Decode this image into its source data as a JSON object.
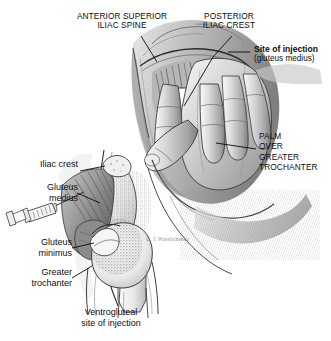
{
  "figure": {
    "background_color": "#ffffff",
    "ink_color": "#1a1a1a"
  },
  "labels": {
    "anterior_superior_iliac_spine": "ANTERIOR SUPERIOR\nILIAC SPINE",
    "posterior_iliac_crest": "POSTERIOR\nILIAC CREST",
    "site_of_injection": "Site of injection",
    "site_of_injection_sub": "(gluteus medius)",
    "palm_over_greater_trochanter": "PALM\nOVER\nGREATER\nTROCHANTER",
    "iliac_crest": "Iliac crest",
    "gluteus_medius": "Gluteus\nmedius",
    "gluteus_minimus": "Gluteus\nminimus",
    "greater_trochanter": "Greater\ntrochanter",
    "caption": "Ventrogluteal\nsite of injection",
    "artist_signature": "G. J. Wassilchenko"
  },
  "colors": {
    "line": "#1a1a1a",
    "leader": "#000000",
    "skin_light": "#dcdcdc",
    "skin_mid": "#b4b4b4",
    "skin_dark": "#8a8a8a",
    "shadow": "#5e5e5e",
    "muscle": "#9a9a9a",
    "bone_light": "#efefef",
    "bone_stipple": "#7a7a7a",
    "injection_triangle": "#ffffff",
    "syringe": "#f2f2f2",
    "signature": "#8d8d8d"
  }
}
